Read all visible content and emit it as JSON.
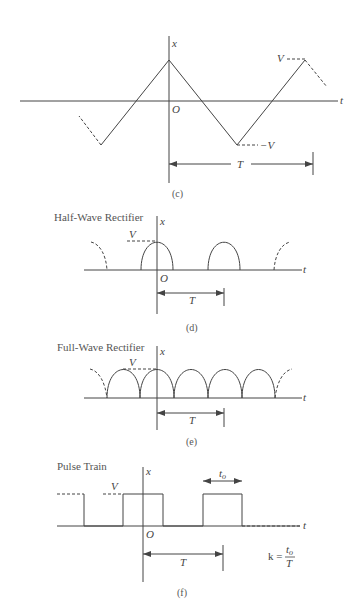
{
  "panels": [
    {
      "id": "c",
      "title": "",
      "caption": "(c)",
      "labels": {
        "x_axis": "x",
        "t_axis": "t",
        "origin": "O",
        "peak": "V",
        "trough": "−V",
        "period": "T"
      }
    },
    {
      "id": "d",
      "title": "Half-Wave Rectifier",
      "caption": "(d)",
      "labels": {
        "x_axis": "x",
        "t_axis": "t",
        "origin": "O",
        "peak": "V",
        "period": "T"
      }
    },
    {
      "id": "e",
      "title": "Full-Wave Rectifier",
      "caption": "(e)",
      "labels": {
        "x_axis": "x",
        "t_axis": "t",
        "peak": "V",
        "period": "T"
      }
    },
    {
      "id": "f",
      "title": "Pulse Train",
      "caption": "(f)",
      "labels": {
        "x_axis": "x",
        "t_axis": "t",
        "origin": "O",
        "peak": "V",
        "period": "T",
        "pulse_width": "t",
        "pulse_width_sub": "o",
        "duty_k": "k =",
        "duty_num": "t",
        "duty_num_sub": "o",
        "duty_den": "T"
      }
    }
  ],
  "colors": {
    "line": "#444444",
    "text": "#444444"
  }
}
